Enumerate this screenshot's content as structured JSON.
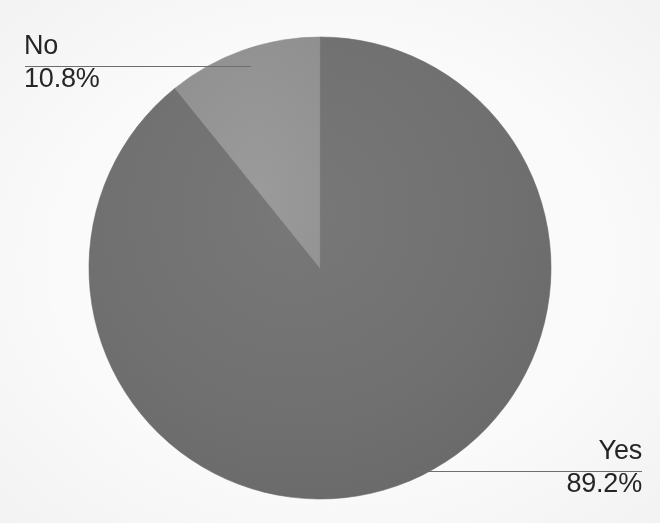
{
  "chart_data": {
    "type": "pie",
    "title": "",
    "subtitle": "",
    "labels": [
      "Yes",
      "No"
    ],
    "values": [
      89.2,
      10.8
    ],
    "value_labels": [
      "89.2%",
      "10.8%"
    ],
    "units": "percent",
    "legend": "none",
    "grid": false,
    "start_angle_deg": 0,
    "direction": "clockwise",
    "colors": [
      "#707070",
      "#969696"
    ],
    "slices": [
      {
        "label": "Yes",
        "value": 89.2,
        "value_label": "89.2%",
        "color": "#707070",
        "start_angle_deg": 0,
        "end_angle_deg": 321.12,
        "label_position": "bottom-right",
        "leader_line": true
      },
      {
        "label": "No",
        "value": 10.8,
        "value_label": "10.8%",
        "color": "#969696",
        "start_angle_deg": 321.12,
        "end_angle_deg": 360,
        "label_position": "top-left",
        "leader_line": true
      }
    ]
  },
  "geometry": {
    "center_x": 320,
    "center_y": 268,
    "radius": 231
  },
  "labels": {
    "no": {
      "name": "No",
      "percent": "10.8%"
    },
    "yes": {
      "name": "Yes",
      "percent": "89.2%"
    }
  },
  "colors": {
    "slice_yes": "#707070",
    "slice_no": "#969696",
    "leader_line": "#6f6f6f",
    "text": "#262626",
    "background": "#fdfdfd"
  }
}
